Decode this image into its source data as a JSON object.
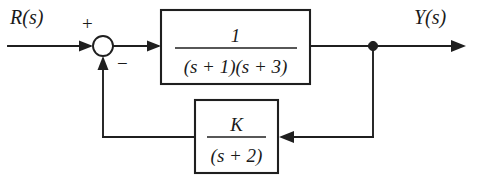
{
  "diagram": {
    "type": "control-block-diagram",
    "background_color": "#ffffff",
    "line_color": "#1f1f1f",
    "width": 480,
    "height": 191
  },
  "signals": {
    "input_label": "R(s)",
    "output_label": "Y(s)"
  },
  "summing_junction": {
    "name": "summing-junction",
    "positive_sign": "+",
    "negative_sign": "−",
    "center_x": 103,
    "center_y": 46,
    "radius": 10
  },
  "forward_block": {
    "name": "forward-path-transfer-function",
    "numerator": "1",
    "denominator": "(s + 1)(s + 3)",
    "denominator_parts": [
      {
        "open": "(",
        "var": "s",
        "op": " + ",
        "num": "1",
        "close": ")"
      },
      {
        "open": "(",
        "var": "s",
        "op": " + ",
        "num": "3",
        "close": ")"
      }
    ],
    "x": 161,
    "y": 10,
    "width": 149,
    "height": 74
  },
  "feedback_block": {
    "name": "feedback-path-transfer-function",
    "numerator": "K",
    "denominator": "(s + 2)",
    "denominator_parts": [
      {
        "open": "(",
        "var": "s",
        "op": " + ",
        "num": "2",
        "close": ")"
      }
    ],
    "x": 195,
    "y": 100,
    "width": 83,
    "height": 73
  },
  "takeoff_node": {
    "name": "output-takeoff-node",
    "x": 373,
    "y": 46
  },
  "wires": {
    "input_wire": "R(s) to summing junction",
    "error_wire": "summing junction to forward block",
    "output_wire": "forward block to Y(s)",
    "feedback_down_wire": "takeoff node down to feedback level",
    "feedback_into_block_wire": "right wire into feedback block",
    "feedback_out_wire": "feedback block to summing junction",
    "feedback_up_wire": "feedback up into summing junction"
  }
}
